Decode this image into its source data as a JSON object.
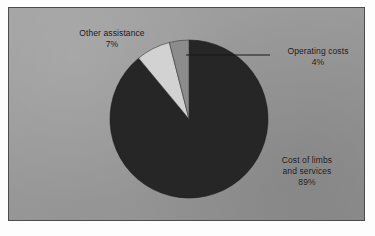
{
  "figure": {
    "background_color": "#fdfdfd",
    "panel_color": "#9a9a9a",
    "panel_border_color": "#4c4c4c"
  },
  "chart_data": {
    "type": "pie",
    "title": "",
    "subtitle": "",
    "xlabel": "",
    "ylabel": "",
    "grid": false,
    "legend_position": "none",
    "labels_position": "outside-with-leader-lines",
    "start_angle_deg": 90,
    "direction": "clockwise",
    "units": "percent",
    "categories": [
      "Cost of limbs and services",
      "Other assistance",
      "Operating costs"
    ],
    "values": [
      89,
      7,
      4
    ],
    "slices": [
      {
        "name": "Cost of limbs and services",
        "label_line_1": "Cost of limbs",
        "label_line_2": "and services",
        "value": 89,
        "value_label": "89%",
        "color": "#262626",
        "start_deg": 90,
        "end_deg": -230.4
      },
      {
        "name": "Other assistance",
        "label_line_1": "Other assistance",
        "label_line_2": "",
        "value": 7,
        "value_label": "7%",
        "color": "#d2d2d2",
        "start_deg": 129.6,
        "end_deg": 104.4
      },
      {
        "name": "Operating costs",
        "label_line_1": "Operating costs",
        "label_line_2": "",
        "value": 4,
        "value_label": "4%",
        "color": "#8c8c8c",
        "start_deg": 104.4,
        "end_deg": 90
      }
    ],
    "annotations": [
      {
        "name": "operating-costs-leader-line",
        "from_x": 186,
        "from_y": 55,
        "to_x": 270,
        "to_y": 55
      }
    ]
  },
  "geometry": {
    "center_x": 189,
    "center_y": 119,
    "radius": 79
  }
}
